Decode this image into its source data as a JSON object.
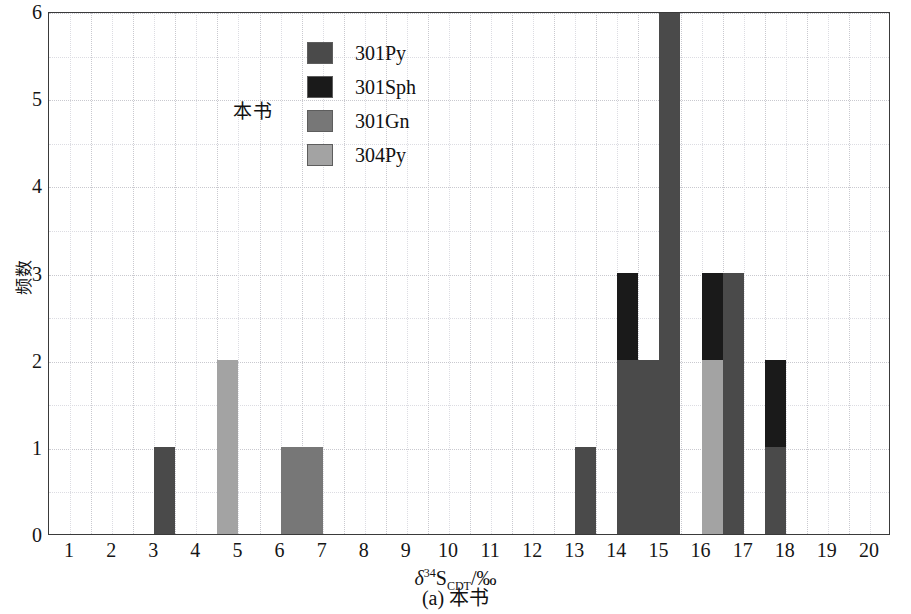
{
  "chart_data": {
    "type": "bar",
    "title": "",
    "subtitle": "",
    "caption": "(a) 本书",
    "annotation": "本书",
    "xlabel_parts": {
      "delta": "δ",
      "sup": "34",
      "element": "S",
      "sub": "CDT",
      "unit": "/‰"
    },
    "xlabel": "δ³⁴S_CDT/‰",
    "ylabel": "频数",
    "xlim": [
      0,
      20
    ],
    "ylim": [
      0,
      6
    ],
    "xticks": [
      1,
      2,
      3,
      4,
      5,
      6,
      7,
      8,
      9,
      10,
      11,
      12,
      13,
      14,
      15,
      16,
      17,
      18,
      19,
      20
    ],
    "yticks": [
      0,
      1,
      2,
      3,
      4,
      5,
      6
    ],
    "grid": true,
    "grid_major_y_step": 1,
    "grid_minor_y_step": 0.5,
    "grid_major_x_step": 1,
    "grid_minor_x_step": 0.5,
    "legend_position": "upper-center",
    "bin_width": 0.5,
    "series": [
      {
        "name": "301Py",
        "color": "#4a4a4a"
      },
      {
        "name": "301Sph",
        "color": "#1a1a1a"
      },
      {
        "name": "301Gn",
        "color": "#777777"
      },
      {
        "name": "304Py",
        "color": "#a3a3a3"
      }
    ],
    "bars": [
      {
        "x_start": 2.5,
        "x_end": 3.0,
        "stack": [
          {
            "series": "301Py",
            "value": 1
          }
        ]
      },
      {
        "x_start": 4.0,
        "x_end": 4.5,
        "stack": [
          {
            "series": "304Py",
            "value": 2
          }
        ]
      },
      {
        "x_start": 5.5,
        "x_end": 6.0,
        "stack": [
          {
            "series": "301Gn",
            "value": 1
          }
        ]
      },
      {
        "x_start": 6.0,
        "x_end": 6.5,
        "stack": [
          {
            "series": "301Gn",
            "value": 1
          }
        ]
      },
      {
        "x_start": 12.5,
        "x_end": 13.0,
        "stack": [
          {
            "series": "301Py",
            "value": 1
          }
        ]
      },
      {
        "x_start": 13.5,
        "x_end": 14.0,
        "stack": [
          {
            "series": "301Py",
            "value": 2
          },
          {
            "series": "301Sph",
            "value": 1
          }
        ]
      },
      {
        "x_start": 14.0,
        "x_end": 14.5,
        "stack": [
          {
            "series": "301Py",
            "value": 2
          }
        ]
      },
      {
        "x_start": 14.5,
        "x_end": 15.0,
        "stack": [
          {
            "series": "301Py",
            "value": 6
          }
        ]
      },
      {
        "x_start": 15.5,
        "x_end": 16.0,
        "stack": [
          {
            "series": "304Py",
            "value": 2
          },
          {
            "series": "301Sph",
            "value": 1
          }
        ]
      },
      {
        "x_start": 16.0,
        "x_end": 16.5,
        "stack": [
          {
            "series": "301Py",
            "value": 3
          }
        ]
      },
      {
        "x_start": 17.0,
        "x_end": 17.5,
        "stack": [
          {
            "series": "301Py",
            "value": 1
          },
          {
            "series": "301Sph",
            "value": 1
          }
        ]
      }
    ]
  },
  "legend": {
    "items": [
      {
        "label": "301Py"
      },
      {
        "label": "301Sph"
      },
      {
        "label": "301Gn"
      },
      {
        "label": "304Py"
      }
    ]
  }
}
